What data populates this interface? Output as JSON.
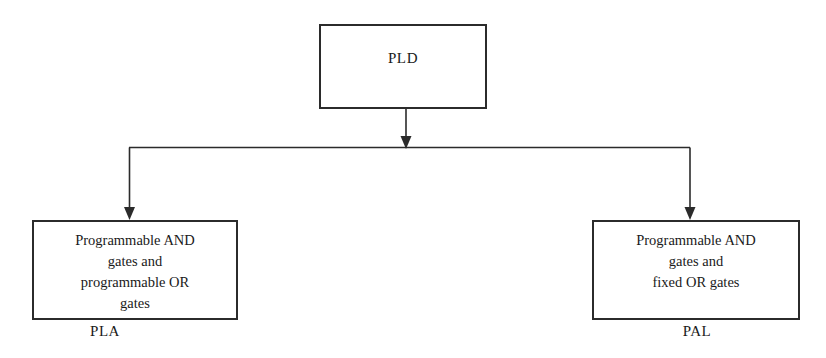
{
  "diagram": {
    "title_node": {
      "label": "PLD"
    },
    "branches": [
      {
        "key": "pla",
        "lines": [
          "Programmable AND",
          "gates  and",
          "programmable OR",
          "gates"
        ],
        "caption": "PLA"
      },
      {
        "key": "pal",
        "lines": [
          "Programmable AND",
          "gates  and",
          "fixed OR gates"
        ],
        "caption": "PAL"
      }
    ],
    "colors": {
      "background": "#ffffff",
      "stroke": "#2b2b2b",
      "text": "#1a1a1a"
    }
  }
}
